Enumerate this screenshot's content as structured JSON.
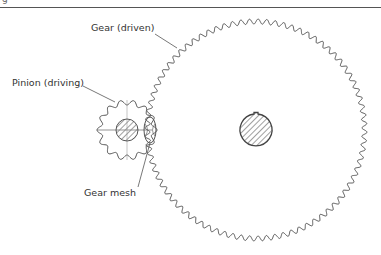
{
  "figure": {
    "corner_text": "g",
    "labels": {
      "driven_gear": "Gear (driven)",
      "driving_pinion": "Pinion (driving)",
      "mesh": "Gear mesh"
    },
    "colors": {
      "line": "#555555",
      "hatch": "#888888",
      "text": "#333333"
    },
    "pinion": {
      "cx": 127,
      "cy": 130,
      "outer_r": 30,
      "inner_r": 25,
      "teeth": 14,
      "hub_r": 11
    },
    "gear": {
      "cx": 256,
      "cy": 130,
      "outer_r": 111,
      "inner_r": 106,
      "teeth": 80,
      "hub_r": 16
    }
  }
}
